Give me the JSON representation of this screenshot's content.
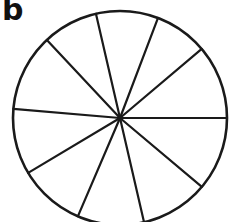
{
  "figure": {
    "panel_label": "b",
    "caption_position": "top-left",
    "background_color": "#ffffff",
    "stroke_color": "#1a1a1a",
    "fill_color": "#ffffff",
    "canvas": {
      "width": 232,
      "height": 222
    }
  },
  "chart_data": {
    "type": "pie",
    "title": "b",
    "subtitle": "",
    "xlabel": "",
    "ylabel": "",
    "legend": "none",
    "grid": false,
    "labels_shown": false,
    "center": {
      "x": 120,
      "y": 118
    },
    "radius": 107,
    "outline_width": 2.6,
    "spoke_width": 2.2,
    "slice_count": 10,
    "categories": [
      "s1",
      "s2",
      "s3",
      "s4",
      "s5",
      "s6",
      "s7",
      "s8",
      "s9",
      "s10"
    ],
    "values": [
      31,
      38,
      34,
      30,
      42,
      36,
      39,
      36,
      37,
      37
    ],
    "spoke_angles_deg": [
      0,
      38,
      69,
      103,
      133,
      175,
      211,
      247,
      283,
      320
    ],
    "spoke_endpoints": [
      {
        "name": "spoke-right",
        "x": 227,
        "y": 118
      },
      {
        "name": "spoke-up-right",
        "x": 204,
        "y": 47
      },
      {
        "name": "spoke-up-near-vertical",
        "x": 158,
        "y": 18
      },
      {
        "name": "spoke-up-left-steep",
        "x": 96,
        "y": 14
      },
      {
        "name": "spoke-up-left",
        "x": 47,
        "y": 40
      },
      {
        "name": "spoke-left",
        "x": 14,
        "y": 109
      },
      {
        "name": "spoke-left-down",
        "x": 28,
        "y": 173
      },
      {
        "name": "spoke-down-left",
        "x": 78,
        "y": 216
      },
      {
        "name": "spoke-down-near-vertical",
        "x": 144,
        "y": 222
      },
      {
        "name": "spoke-down-right",
        "x": 202,
        "y": 187
      }
    ],
    "ylim": [
      0,
      0
    ],
    "units": "degrees"
  }
}
